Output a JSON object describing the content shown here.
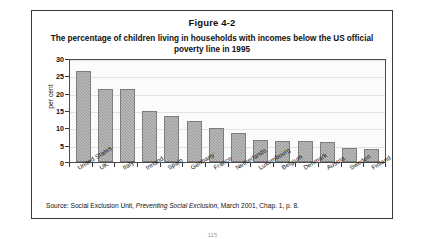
{
  "figure": {
    "number": "Figure 4-2",
    "title": "The percentage of children living in households with incomes below the US official poverty line in 1995",
    "source_prefix": "Source: Social Exclusion Unit,",
    "source_italic": "Preventing Social Exclusion",
    "source_suffix": ", March 2001, Chap. 1, p. 8.",
    "page_number": "115"
  },
  "chart_data": {
    "type": "bar",
    "title": "The percentage of children living in households with incomes below the US official poverty line in 1995",
    "xlabel": "",
    "ylabel": "per cent",
    "ylim": [
      0,
      30
    ],
    "yticks": [
      0,
      5,
      10,
      15,
      20,
      25,
      30
    ],
    "ytick_labels": [
      "0",
      "5",
      "10",
      "15",
      "20",
      "25",
      "30"
    ],
    "grid": true,
    "legend": false,
    "bar_color": "#9a9a9a",
    "categories": [
      "United States",
      "UK",
      "Italy",
      "Ireland",
      "Spain",
      "Germany",
      "France",
      "Netherlands",
      "Luxembourg",
      "Belgium",
      "Denmark",
      "Austria",
      "Sweden",
      "Finland"
    ],
    "values": [
      26.3,
      21.0,
      21.0,
      14.8,
      13.4,
      11.8,
      9.9,
      8.5,
      6.3,
      6.2,
      6.0,
      5.7,
      4.0,
      3.7
    ]
  }
}
